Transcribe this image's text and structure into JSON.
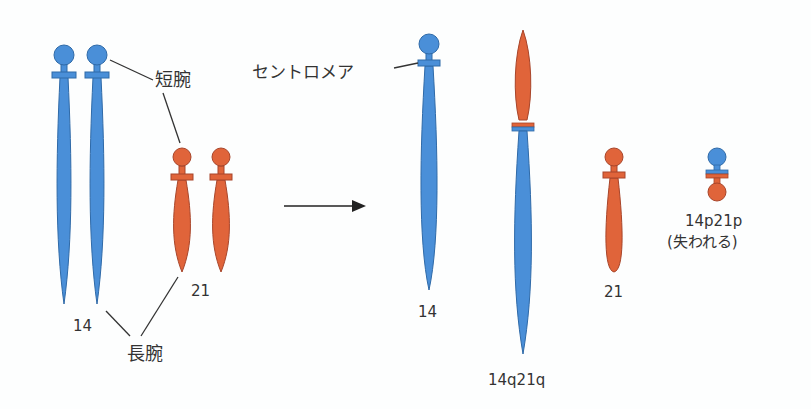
{
  "diagram": {
    "colors": {
      "chr14": "#4a8fd8",
      "chr14_stroke": "#2f6aa8",
      "chr21": "#e0643a",
      "chr21_stroke": "#a8452a",
      "line": "#333333",
      "background": "#fdfefe"
    },
    "labels": {
      "short_arm": "短腕",
      "long_arm": "長腕",
      "centromere": "セントロメア",
      "before_14": "14",
      "before_21": "21",
      "after_14": "14",
      "after_fusion": "14q21q",
      "after_21": "21",
      "lost_name": "14p21p",
      "lost_note": "(失われる)"
    },
    "arrow": {
      "direction": "right",
      "meaning": "translocation"
    }
  }
}
